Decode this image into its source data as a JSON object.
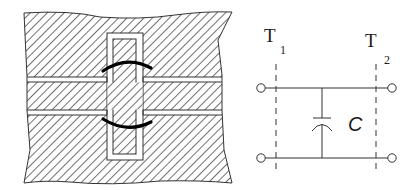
{
  "figure": {
    "left_panel": {
      "description": "Cross-section of stacked hatched conductor layers with a vertical via and curved field-line arcs",
      "layers": 3,
      "hatch_color": "#2a2a2a",
      "arc_color": "#000000"
    },
    "right_panel": {
      "description": "Equivalent circuit: shunt capacitor between two reference planes",
      "terminals": [
        {
          "label": "T",
          "subscript": "1"
        },
        {
          "label": "T",
          "subscript": "2"
        }
      ],
      "component": {
        "type": "capacitor",
        "label": "C"
      }
    }
  }
}
